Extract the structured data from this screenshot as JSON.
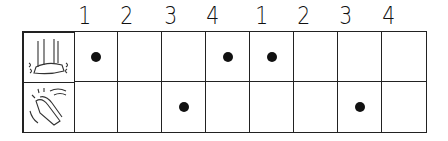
{
  "beats": [
    "1",
    "2",
    "3",
    "4",
    "1",
    "2",
    "3",
    "4"
  ],
  "rows": [
    {
      "icon": "stomp-foot-icon",
      "hits": [
        true,
        false,
        false,
        true,
        true,
        false,
        false,
        false
      ]
    },
    {
      "icon": "clap-hands-icon",
      "hits": [
        false,
        false,
        true,
        false,
        false,
        false,
        true,
        false
      ]
    }
  ]
}
